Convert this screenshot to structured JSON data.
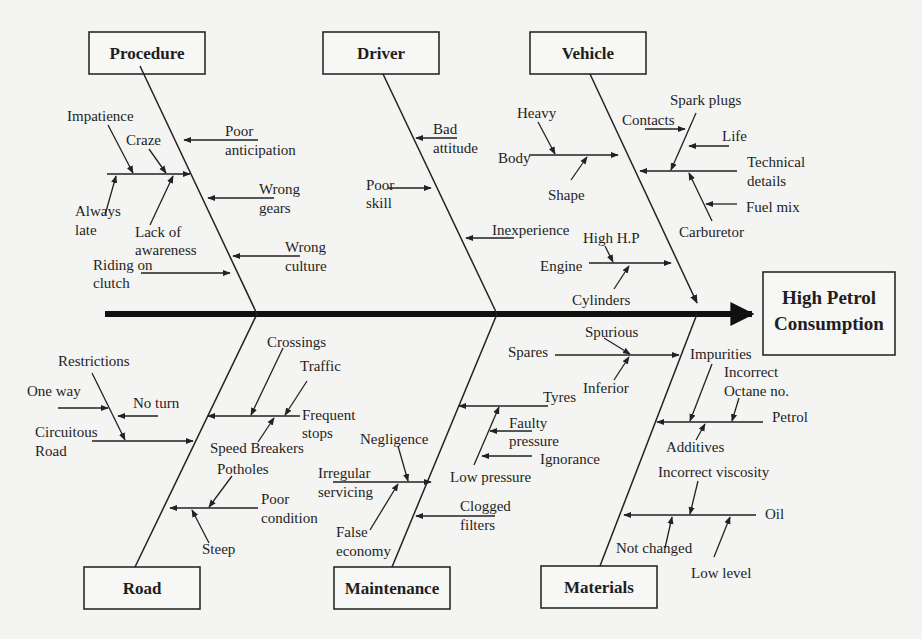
{
  "diagram": {
    "type": "fishbone (Ishikawa) cause-and-effect diagram",
    "effect": {
      "line1": "High  Petrol",
      "line2": "Consumption"
    },
    "categories": {
      "procedure": {
        "title": "Procedure",
        "causes": {
          "impatience": "Impatience",
          "craze": "Craze",
          "always_late_1": "Always",
          "always_late_2": "late",
          "lack_awareness_1": "Lack of",
          "lack_awareness_2": "awareness",
          "poor_anticipation_1": "Poor",
          "poor_anticipation_2": "anticipation",
          "wrong_gears_1": "Wrong",
          "wrong_gears_2": "gears",
          "wrong_culture_1": "Wrong",
          "wrong_culture_2": "culture",
          "riding_clutch_1": "Riding on",
          "riding_clutch_2": "clutch"
        }
      },
      "driver": {
        "title": "Driver",
        "causes": {
          "bad_attitude_1": "Bad",
          "bad_attitude_2": "attitude",
          "poor_skill_1": "Poor",
          "poor_skill_2": "skill",
          "inexperience": "Inexperience"
        }
      },
      "vehicle": {
        "title": "Vehicle",
        "causes": {
          "heavy": "Heavy",
          "body": "Body",
          "shape": "Shape",
          "spark_plugs": "Spark plugs",
          "contacts": "Contacts",
          "life": "Life",
          "technical_details_1": "Technical",
          "technical_details_2": "details",
          "fuel_mix": "Fuel mix",
          "carburetor": "Carburetor",
          "high_hp": "High H.P",
          "engine": "Engine",
          "cylinders": "Cylinders"
        }
      },
      "road": {
        "title": "Road",
        "causes": {
          "restrictions": "Restrictions",
          "one_way": "One way",
          "no_turn": "No turn",
          "circuitous_road_1": "Circuitous",
          "circuitous_road_2": "Road",
          "crossings": "Crossings",
          "traffic": "Traffic",
          "frequent_stops_1": "Frequent",
          "frequent_stops_2": "stops",
          "speed_breakers": "Speed Breakers",
          "potholes": "Potholes",
          "poor_condition_1": "Poor",
          "poor_condition_2": "condition",
          "steep": "Steep"
        }
      },
      "maintenance": {
        "title": "Maintenance",
        "causes": {
          "negligence": "Negligence",
          "irregular_servicing_1": "Irregular",
          "irregular_servicing_2": "servicing",
          "false_economy_1": "False",
          "false_economy_2": "economy",
          "tyres": "Tyres",
          "faulty_pressure_1": "Faulty",
          "faulty_pressure_2": "pressure",
          "ignorance": "Ignorance",
          "low_pressure": "Low pressure",
          "clogged_filters_1": "Clogged",
          "clogged_filters_2": "filters"
        }
      },
      "materials": {
        "title": "Materials",
        "causes": {
          "spares": "Spares",
          "spurious": "Spurious",
          "inferior": "Inferior",
          "impurities": "Impurities",
          "incorrect_octane_1": "Incorrect",
          "incorrect_octane_2": "Octane no.",
          "petrol": "Petrol",
          "additives": "Additives",
          "incorrect_viscosity": "Incorrect viscosity",
          "oil": "Oil",
          "not_changed": "Not changed",
          "low_level": "Low level"
        }
      }
    }
  }
}
